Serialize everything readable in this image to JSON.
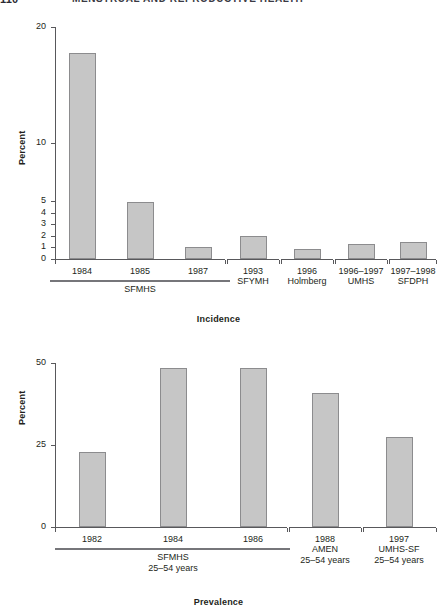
{
  "header": {
    "page_number": "110",
    "running_title": "MENSTRUAL AND REPRODUCTIVE HEALTH"
  },
  "chart_data": [
    {
      "id": "incidence",
      "type": "bar",
      "title": "",
      "xlabel": "Incidence",
      "ylabel": "Percent",
      "ylim": [
        0,
        20
      ],
      "grid": false,
      "legend": null,
      "yticks": [
        0,
        1,
        2,
        3,
        4,
        5,
        10,
        20
      ],
      "ytick_labels": [
        "0",
        "1",
        "2",
        "3",
        "4",
        "5",
        "10",
        "20"
      ],
      "y_scale": "compressed-upper (0-5 expanded, 5-20 compressed)",
      "categories": [
        "1984",
        "1985",
        "1987",
        "1993",
        "1996",
        "1996–1997",
        "1997–1998"
      ],
      "values": [
        17.8,
        4.9,
        1.0,
        2.0,
        0.85,
        1.3,
        1.45
      ],
      "groups": [
        {
          "label": "SFMHS",
          "sublabel": "",
          "categories": [
            "1984",
            "1985",
            "1987"
          ],
          "rule": true
        },
        {
          "label": "SFYMH",
          "sublabel": "",
          "categories": [
            "1993"
          ],
          "rule": false
        },
        {
          "label": "Holmberg",
          "sublabel": "",
          "categories": [
            "1996"
          ],
          "rule": false
        },
        {
          "label": "UMHS",
          "sublabel": "",
          "categories": [
            "1996–1997"
          ],
          "rule": false
        },
        {
          "label": "SFDPH",
          "sublabel": "",
          "categories": [
            "1997–1998"
          ],
          "rule": false
        }
      ]
    },
    {
      "id": "prevalence",
      "type": "bar",
      "title": "",
      "xlabel": "Prevalence",
      "ylabel": "Percent",
      "ylim": [
        0,
        50
      ],
      "grid": false,
      "legend": null,
      "yticks": [
        0,
        25,
        50
      ],
      "ytick_labels": [
        "0",
        "25",
        "50"
      ],
      "y_scale": "linear",
      "categories": [
        "1982",
        "1984",
        "1986",
        "1988",
        "1997"
      ],
      "values": [
        23,
        48.5,
        48.5,
        41,
        27.5
      ],
      "groups": [
        {
          "label": "SFMHS",
          "sublabel": "25–54 years",
          "categories": [
            "1982",
            "1984",
            "1986"
          ],
          "rule": true
        },
        {
          "label": "AMEN",
          "sublabel": "25–54 years",
          "categories": [
            "1988"
          ],
          "rule": false
        },
        {
          "label": "UMHS-SF",
          "sublabel": "25–54 years",
          "categories": [
            "1997"
          ],
          "rule": false
        }
      ]
    }
  ],
  "colors": {
    "bar_fill": "#c6c6c6",
    "bar_stroke": "#8c8c8e",
    "axis": "#58585b",
    "text": "#231f20",
    "background": "#ffffff"
  }
}
